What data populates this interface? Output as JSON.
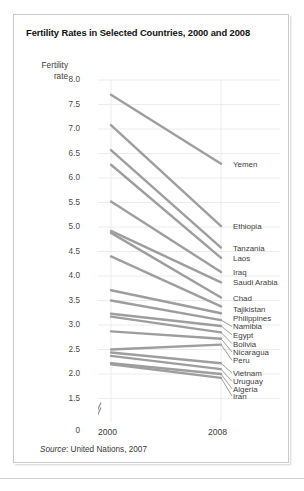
{
  "card": {
    "title": "Fertility Rates in Selected Countries, 2000 and 2008",
    "source_prefix": "Source",
    "source_text": ": United Nations, 2007"
  },
  "chart_data": {
    "type": "line",
    "title": "Fertility Rates in Selected Countries, 2000 and 2008",
    "xlabel": "",
    "ylabel": "Fertility rate",
    "ylabel_line1": "Fertility",
    "ylabel_line2": "rate",
    "x": [
      "2000",
      "2008"
    ],
    "xlim": [
      2000,
      2008
    ],
    "ylim": [
      1.5,
      8.0
    ],
    "axis_break": true,
    "axis_break_zero_label": "0",
    "grid": true,
    "legend": "right-labels",
    "yticks": [
      "8.0",
      "7.5",
      "7.0",
      "6.5",
      "6.0",
      "5.5",
      "5.0",
      "4.5",
      "4.0",
      "3.5",
      "3.0",
      "2.5",
      "2.0",
      "1.5",
      "0"
    ],
    "ytick_values": [
      8.0,
      7.5,
      7.0,
      6.5,
      6.0,
      5.5,
      5.0,
      4.5,
      4.0,
      3.5,
      3.0,
      2.5,
      2.0,
      1.5
    ],
    "xticks": [
      "2000",
      "2008"
    ],
    "line_color": "#9e9e9e",
    "grid_color": "#ececed",
    "series": [
      {
        "name": "Yemen",
        "values": [
          7.7,
          6.29
        ]
      },
      {
        "name": "Ethiopia",
        "values": [
          7.08,
          5.02
        ]
      },
      {
        "name": "Tanzania",
        "values": [
          6.57,
          4.58
        ]
      },
      {
        "name": "Laos",
        "values": [
          6.27,
          4.37
        ]
      },
      {
        "name": "Iraq",
        "values": [
          5.52,
          4.08
        ]
      },
      {
        "name": "Saudi Arabia",
        "values": [
          4.92,
          3.87
        ]
      },
      {
        "name": "Chad",
        "values": [
          4.88,
          3.56
        ]
      },
      {
        "name": "Tajikistan",
        "values": [
          4.4,
          3.38
        ]
      },
      {
        "name": "Philippines",
        "values": [
          3.71,
          3.24
        ]
      },
      {
        "name": "Namibia",
        "values": [
          3.5,
          3.1
        ]
      },
      {
        "name": "Egypt",
        "values": [
          3.23,
          2.98
        ]
      },
      {
        "name": "Bolivia",
        "values": [
          3.17,
          2.85
        ]
      },
      {
        "name": "Nicaragua",
        "values": [
          2.87,
          2.72
        ]
      },
      {
        "name": "Peru",
        "values": [
          2.5,
          2.6
        ]
      },
      {
        "name": "Vietnam",
        "values": [
          2.44,
          2.22
        ]
      },
      {
        "name": "Uruguay",
        "values": [
          2.37,
          2.1
        ]
      },
      {
        "name": "Algeria",
        "values": [
          2.22,
          2.0
        ]
      },
      {
        "name": "Iran",
        "values": [
          2.2,
          1.92
        ]
      }
    ],
    "right_labels": [
      {
        "label": "Yemen",
        "y": 6.29
      },
      {
        "label": "Ethiopia",
        "y": 5.02
      },
      {
        "label": "Tanzania",
        "y": 4.58
      },
      {
        "label": "Laos",
        "y": 4.37
      },
      {
        "label": "Iraq",
        "y": 4.08
      },
      {
        "label": "Saudi Arabia",
        "y": 3.87
      },
      {
        "label": "Chad",
        "y": 3.56
      },
      {
        "label": "Tajikistan",
        "y": 3.33
      },
      {
        "label": "Philippines",
        "y": 3.15
      },
      {
        "label": "Namibia",
        "y": 2.97
      },
      {
        "label": "Egypt",
        "y": 2.8
      },
      {
        "label": "Bolivia",
        "y": 2.62
      },
      {
        "label": "Nicaragua",
        "y": 2.45
      },
      {
        "label": "Peru",
        "y": 2.28
      },
      {
        "label": "Vietnam",
        "y": 2.02
      },
      {
        "label": "Uruguay",
        "y": 1.85
      },
      {
        "label": "Algeria",
        "y": 1.7
      },
      {
        "label": "Iran",
        "y": 1.55
      }
    ]
  }
}
